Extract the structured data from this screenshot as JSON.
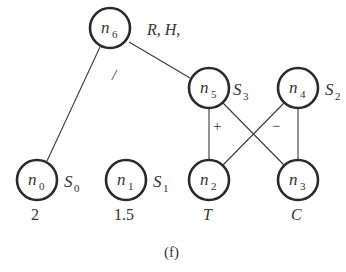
{
  "caption": "(f)",
  "nodes": [
    {
      "id": "n6",
      "name": "n",
      "sub": "6",
      "cx": 110,
      "cy": 28,
      "side_label": "R, H,",
      "below_label": ""
    },
    {
      "id": "n5",
      "name": "n",
      "sub": "5",
      "cx": 209,
      "cy": 88,
      "side_label_main": "S",
      "side_label_sub": "3",
      "below_label": ""
    },
    {
      "id": "n4",
      "name": "n",
      "sub": "4",
      "cx": 298,
      "cy": 88,
      "side_label_main": "S",
      "side_label_sub": "2",
      "below_label": ""
    },
    {
      "id": "n0",
      "name": "n",
      "sub": "0",
      "cx": 37,
      "cy": 180,
      "side_label_main": "S",
      "side_label_sub": "0",
      "below_label": "2"
    },
    {
      "id": "n1",
      "name": "n",
      "sub": "1",
      "cx": 126,
      "cy": 180,
      "side_label_main": "S",
      "side_label_sub": "1",
      "below_label": "1.5"
    },
    {
      "id": "n2",
      "name": "n",
      "sub": "2",
      "cx": 209,
      "cy": 180,
      "below_label": "T"
    },
    {
      "id": "n3",
      "name": "n",
      "sub": "3",
      "cx": 298,
      "cy": 180,
      "below_label": "C"
    }
  ],
  "edges": [
    {
      "from": "n6",
      "to": "n0",
      "label": "/"
    },
    {
      "from": "n6",
      "to": "n5",
      "label": ""
    },
    {
      "from": "n5",
      "to": "n2",
      "label": "+"
    },
    {
      "from": "n5",
      "to": "n3",
      "label": ""
    },
    {
      "from": "n4",
      "to": "n2",
      "label": ""
    },
    {
      "from": "n4",
      "to": "n3",
      "label": "−"
    }
  ],
  "labels": {
    "n6_side": "R, H,",
    "edge_n6_n0": "/",
    "edge_plus": "+",
    "edge_minus": "−",
    "n5_side_main": "S",
    "n5_side_sub": "3",
    "n4_side_main": "S",
    "n4_side_sub": "2",
    "n0_side_main": "S",
    "n0_side_sub": "0",
    "n1_side_main": "S",
    "n1_side_sub": "1",
    "n0_value": "2",
    "n1_value": "1.5",
    "n2_type": "T",
    "n3_type": "C",
    "n_letter": "n",
    "n6_sub": "6",
    "n5_sub": "5",
    "n4_sub": "4",
    "n0_sub": "0",
    "n1_sub": "1",
    "n2_sub": "2",
    "n3_sub": "3"
  }
}
